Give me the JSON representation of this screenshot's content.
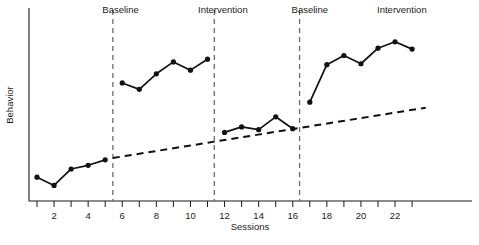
{
  "chart_data": {
    "type": "line",
    "title": "",
    "xlabel": "Sessions",
    "ylabel": "Behavior",
    "design": "ABAB reversal design",
    "grid": false,
    "legend": "none",
    "xlim": [
      0,
      24
    ],
    "ylim": [
      0,
      10
    ],
    "x_ticks": [
      1,
      2,
      3,
      4,
      5,
      6,
      7,
      8,
      9,
      10,
      11,
      12,
      13,
      14,
      15,
      16,
      17,
      18,
      19,
      20,
      21,
      22,
      23
    ],
    "x_tick_labels": [
      "",
      "2",
      "",
      "4",
      "",
      "6",
      "",
      "8",
      "",
      "10",
      "",
      "12",
      "",
      "14",
      "",
      "16",
      "",
      "18",
      "",
      "20",
      "",
      "22",
      ""
    ],
    "y_ticks": [],
    "y_tick_labels": [],
    "phase_labels": [
      "Baseline",
      "Intervention",
      "Baseline",
      "Intervention"
    ],
    "phase_label_x": [
      5.9,
      11.9,
      17.0,
      22.4
    ],
    "phase_change_x": [
      5.45,
      11.4,
      16.4
    ],
    "series": [
      {
        "name": "Baseline 1",
        "phase": "Baseline",
        "x": [
          1,
          2,
          3,
          4,
          5
        ],
        "values": [
          1.3,
          0.85,
          1.75,
          1.95,
          2.25
        ]
      },
      {
        "name": "Intervention 1",
        "phase": "Intervention",
        "x": [
          6,
          7,
          8,
          9,
          10,
          11
        ],
        "values": [
          6.45,
          6.1,
          6.95,
          7.6,
          7.15,
          7.75
        ]
      },
      {
        "name": "Baseline 2",
        "phase": "Baseline",
        "x": [
          12,
          13,
          14,
          15,
          16
        ],
        "values": [
          3.75,
          4.05,
          3.9,
          4.6,
          3.95
        ]
      },
      {
        "name": "Intervention 2",
        "phase": "Intervention",
        "x": [
          17,
          18,
          19,
          20,
          21,
          22,
          23
        ],
        "values": [
          5.4,
          7.45,
          7.95,
          7.5,
          8.35,
          8.7,
          8.3
        ]
      }
    ],
    "trend_line": {
      "name": "Projected baseline trend",
      "style": "dashed",
      "x": [
        5.45,
        23.8
      ],
      "values": [
        2.35,
        5.1
      ]
    }
  },
  "labels": {
    "phase_1": "Baseline",
    "phase_2": "Intervention",
    "phase_3": "Baseline",
    "phase_4": "Intervention",
    "x_axis_title": "Sessions",
    "y_axis_title": "Behavior",
    "tick_2": "2",
    "tick_4": "4",
    "tick_6": "6",
    "tick_8": "8",
    "tick_10": "10",
    "tick_12": "12",
    "tick_14": "14",
    "tick_16": "16",
    "tick_18": "18",
    "tick_20": "20",
    "tick_22": "22"
  },
  "colors": {
    "ink": "#111111",
    "axis": "#1a1a1a",
    "phase_divider": "#6b6b6b",
    "background": "#ffffff"
  }
}
